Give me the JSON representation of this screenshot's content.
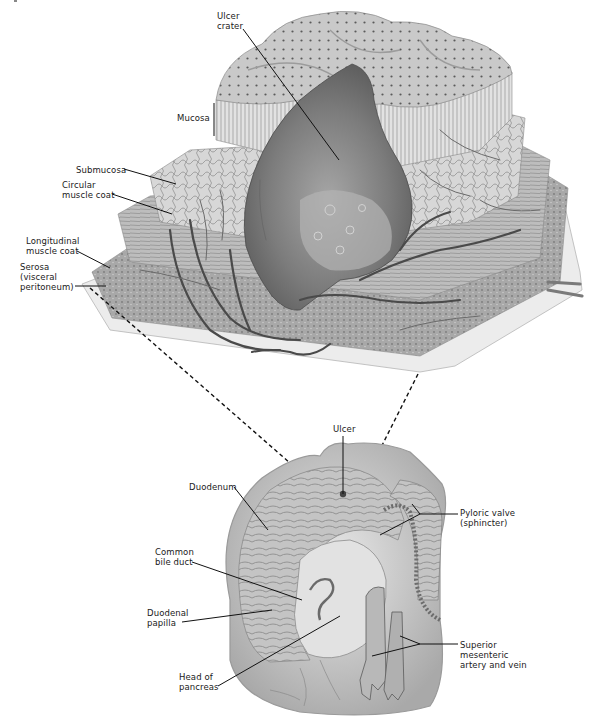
{
  "figure": {
    "upper_panel": {
      "name": "Tissue layers of duodenal wall with ulcer crater",
      "labels": [
        {
          "id": "ulcer-crater",
          "text": "Ulcer\ncrater"
        },
        {
          "id": "mucosa",
          "text": "Mucosa"
        },
        {
          "id": "submucosa",
          "text": "Submucosa"
        },
        {
          "id": "circular-muscle-coat",
          "text": "Circular\nmuscle coat"
        },
        {
          "id": "longitudinal-muscle-coat",
          "text": "Longitudinal\nmuscle coat"
        },
        {
          "id": "serosa",
          "text": "Serosa\n(visceral\nperitoneum)"
        }
      ]
    },
    "lower_panel": {
      "name": "Duodenum and pylorus with ulcer location",
      "labels": [
        {
          "id": "ulcer",
          "text": "Ulcer"
        },
        {
          "id": "duodenum",
          "text": "Duodenum"
        },
        {
          "id": "pyloric-valve",
          "text": "Pyloric valve\n(sphincter)"
        },
        {
          "id": "common-bile-duct",
          "text": "Common\nbile duct"
        },
        {
          "id": "duodenal-papilla",
          "text": "Duodenal\npapilla"
        },
        {
          "id": "superior-mesenteric",
          "text": "Superior\nmesenteric\nartery and vein"
        },
        {
          "id": "head-of-pancreas",
          "text": "Head of\npancreas"
        }
      ]
    },
    "colors": {
      "background": "#ffffff",
      "tissue_light": "#e4e4e4",
      "tissue_mid": "#b8b8b8",
      "tissue_dark": "#7a7a7a",
      "crater": "#6e6e6e",
      "vessel": "#4a4a4a",
      "line": "#111111"
    }
  }
}
